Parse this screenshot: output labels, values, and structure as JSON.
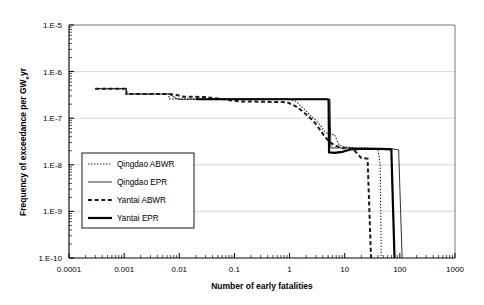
{
  "chart_data": {
    "type": "line",
    "title": "",
    "xlabel": "Number of early fatalities",
    "ylabel": "Frequency of exceedance per GWeyr",
    "ylabel_main": "Frequency of exceedance per GW",
    "ylabel_sub": "e",
    "ylabel_tail": "yr",
    "xscale": "log",
    "yscale": "log",
    "xlim": [
      0.0001,
      1000
    ],
    "ylim": [
      1e-10,
      1e-05
    ],
    "grid": "horizontal-major",
    "legend_position": "inside-left-middle",
    "xticks": [
      "0.0001",
      "0.001",
      "0.01",
      "0.1",
      "1",
      "10",
      "100",
      "1000"
    ],
    "xtick_values": [
      0.0001,
      0.001,
      0.01,
      0.1,
      1,
      10,
      100,
      1000
    ],
    "yticks": [
      "1.E-5",
      "1.E-6",
      "1.E-7",
      "1.E-8",
      "1.E-9",
      "1.E-10"
    ],
    "ytick_values": [
      1e-05,
      1e-06,
      1e-07,
      1e-08,
      1e-09,
      1e-10
    ],
    "series": [
      {
        "name": "Qingdao ABWR",
        "style": "dotted",
        "color": "#1a1a1a",
        "width": 1.1,
        "points": [
          [
            0.0003,
            4.3e-07
          ],
          [
            0.0011,
            4.3e-07
          ],
          [
            0.0011,
            3.3e-07
          ],
          [
            0.0065,
            3.3e-07
          ],
          [
            0.0065,
            2.6e-07
          ],
          [
            0.9,
            2.6e-07
          ],
          [
            1.3,
            2.3e-07
          ],
          [
            1.8,
            1.6e-07
          ],
          [
            2.4,
            1.15e-07
          ],
          [
            3.0,
            9e-08
          ],
          [
            3.6,
            7e-08
          ],
          [
            4.3,
            5.2e-08
          ],
          [
            5.0,
            4.6e-08
          ],
          [
            6.5,
            4.4e-08
          ],
          [
            8.0,
            2.6e-08
          ],
          [
            11.0,
            2.4e-08
          ],
          [
            17.0,
            2.3e-08
          ],
          [
            26.0,
            2.3e-08
          ],
          [
            40.0,
            2.2e-08
          ],
          [
            44.0,
            1e-08
          ],
          [
            46.0,
            1e-10
          ]
        ]
      },
      {
        "name": "Qingdao EPR",
        "style": "solid-thin",
        "color": "#1a1a1a",
        "width": 0.9,
        "points": [
          [
            0.0003,
            4.3e-07
          ],
          [
            0.0011,
            4.3e-07
          ],
          [
            0.0011,
            3.3e-07
          ],
          [
            0.0065,
            3.3e-07
          ],
          [
            0.0075,
            3e-07
          ],
          [
            0.0095,
            2.55e-07
          ],
          [
            0.02,
            2.55e-07
          ],
          [
            4.6,
            2.55e-07
          ],
          [
            5.4,
            2.5e-07
          ],
          [
            5.6,
            2.3e-08
          ],
          [
            12.0,
            2.3e-08
          ],
          [
            30.0,
            2.25e-08
          ],
          [
            70.0,
            2.2e-08
          ],
          [
            95.0,
            2.1e-08
          ],
          [
            110.0,
            1e-10
          ]
        ]
      },
      {
        "name": "Yantai ABWR",
        "style": "dashed",
        "color": "#1a1a1a",
        "width": 2.0,
        "points": [
          [
            0.0003,
            4.3e-07
          ],
          [
            0.0011,
            4.3e-07
          ],
          [
            0.0011,
            3.3e-07
          ],
          [
            0.0065,
            3.3e-07
          ],
          [
            0.0085,
            3.2e-07
          ],
          [
            0.012,
            2.9e-07
          ],
          [
            0.03,
            2.85e-07
          ],
          [
            0.12,
            2.3e-07
          ],
          [
            0.35,
            2.25e-07
          ],
          [
            0.9,
            2.2e-07
          ],
          [
            1.25,
            1.85e-07
          ],
          [
            1.6,
            1.5e-07
          ],
          [
            2.0,
            1.2e-07
          ],
          [
            2.5,
            9.5e-08
          ],
          [
            3.0,
            7.5e-08
          ],
          [
            3.5,
            5.8e-08
          ],
          [
            4.2,
            4.3e-08
          ],
          [
            5.0,
            3.3e-08
          ],
          [
            6.5,
            2.6e-08
          ],
          [
            9.0,
            2.3e-08
          ],
          [
            14.0,
            2.2e-08
          ],
          [
            20.0,
            1.4e-08
          ],
          [
            26.0,
            1.35e-08
          ],
          [
            30.0,
            1e-10
          ]
        ]
      },
      {
        "name": "Yantai EPR",
        "style": "solid-thick",
        "color": "#000000",
        "width": 2.2,
        "points": [
          [
            0.02,
            2.55e-07
          ],
          [
            4.8,
            2.55e-07
          ],
          [
            5.1,
            2.5e-07
          ],
          [
            5.2,
            1.85e-08
          ],
          [
            6.5,
            1.8e-08
          ],
          [
            9.0,
            1.9e-08
          ],
          [
            13.0,
            2.15e-08
          ],
          [
            20.0,
            2.2e-08
          ],
          [
            45.0,
            2.2e-08
          ],
          [
            70.0,
            2.15e-08
          ],
          [
            80.0,
            1e-10
          ]
        ]
      }
    ]
  },
  "legend": {
    "items": [
      {
        "label": "Qingdao ABWR",
        "style": "dotted"
      },
      {
        "label": "Qingdao EPR",
        "style": "solid-thin"
      },
      {
        "label": "Yantai ABWR",
        "style": "dashed"
      },
      {
        "label": "Yantai EPR",
        "style": "solid-thick"
      }
    ]
  }
}
